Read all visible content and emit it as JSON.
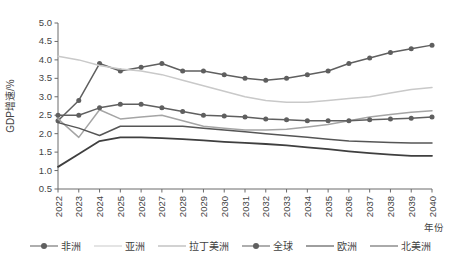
{
  "chart_data": {
    "type": "line",
    "title": "",
    "xlabel": "年份",
    "ylabel": "GDP增速/%",
    "grid": false,
    "legend_position": "bottom",
    "ylim": [
      0.5,
      5.0
    ],
    "ytick_step": 0.5,
    "yticks": [
      "0.5",
      "1.0",
      "1.5",
      "2.0",
      "2.5",
      "3.0",
      "3.5",
      "4.0",
      "4.5",
      "5.0"
    ],
    "categories": [
      "2022",
      "2023",
      "2024",
      "2025",
      "2026",
      "2027",
      "2028",
      "2029",
      "2030",
      "2031",
      "2032",
      "2033",
      "2034",
      "2035",
      "2036",
      "2037",
      "2038",
      "2039",
      "2040"
    ],
    "series": [
      {
        "name": "非洲",
        "color": "#5f5f5f",
        "width": 1.5,
        "marker": "circle",
        "marker_size": 5,
        "values": [
          2.35,
          2.9,
          3.9,
          3.7,
          3.8,
          3.9,
          3.7,
          3.7,
          3.6,
          3.5,
          3.45,
          3.5,
          3.6,
          3.7,
          3.9,
          4.05,
          4.2,
          4.3,
          4.4
        ]
      },
      {
        "name": "亚洲",
        "color": "#c9c9c9",
        "width": 1.5,
        "marker": "none",
        "marker_size": 0,
        "values": [
          4.1,
          4.0,
          3.85,
          3.75,
          3.7,
          3.6,
          3.45,
          3.3,
          3.15,
          3.0,
          2.9,
          2.85,
          2.85,
          2.9,
          2.95,
          3.0,
          3.1,
          3.2,
          3.25
        ]
      },
      {
        "name": "拉丁美洲",
        "color": "#a5a5a5",
        "width": 1.5,
        "marker": "none",
        "marker_size": 0,
        "values": [
          2.4,
          1.9,
          2.65,
          2.4,
          2.45,
          2.5,
          2.35,
          2.2,
          2.15,
          2.1,
          2.1,
          2.12,
          2.18,
          2.25,
          2.35,
          2.45,
          2.52,
          2.58,
          2.62
        ]
      },
      {
        "name": "全球",
        "color": "#5f5f5f",
        "width": 1.5,
        "marker": "circle",
        "marker_size": 5,
        "values": [
          2.5,
          2.5,
          2.7,
          2.8,
          2.8,
          2.7,
          2.6,
          2.5,
          2.48,
          2.45,
          2.4,
          2.38,
          2.35,
          2.35,
          2.35,
          2.38,
          2.4,
          2.42,
          2.45
        ]
      },
      {
        "name": "欧洲",
        "color": "#3f3f3f",
        "width": 1.8,
        "marker": "none",
        "marker_size": 0,
        "values": [
          1.1,
          1.45,
          1.8,
          1.9,
          1.9,
          1.88,
          1.85,
          1.82,
          1.78,
          1.75,
          1.72,
          1.68,
          1.63,
          1.58,
          1.52,
          1.47,
          1.43,
          1.4,
          1.4
        ]
      },
      {
        "name": "北美洲",
        "color": "#565656",
        "width": 1.5,
        "marker": "none",
        "marker_size": 0,
        "values": [
          2.3,
          2.15,
          1.95,
          2.2,
          2.2,
          2.2,
          2.2,
          2.15,
          2.1,
          2.05,
          2.0,
          1.95,
          1.9,
          1.85,
          1.8,
          1.78,
          1.76,
          1.75,
          1.75
        ]
      }
    ]
  }
}
